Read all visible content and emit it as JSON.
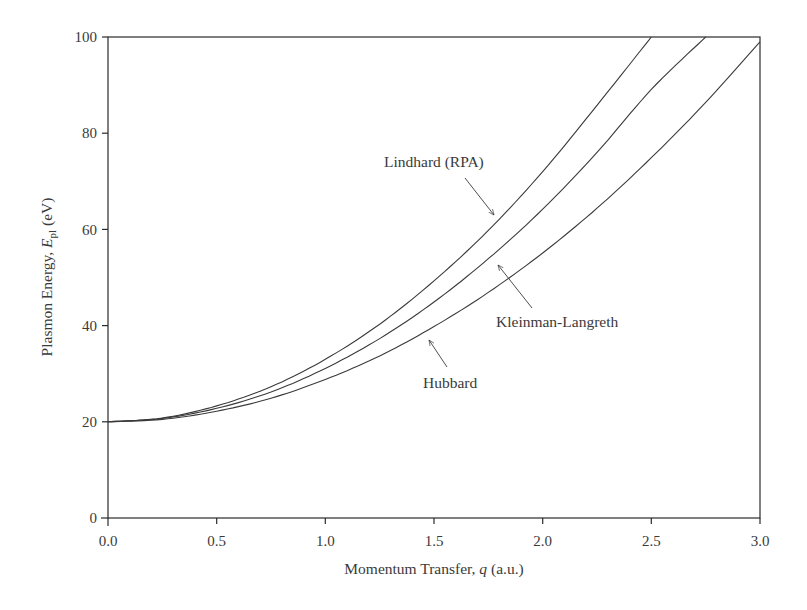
{
  "chart_data": {
    "type": "line",
    "title": "",
    "xlabel": "Momentum Transfer, q (a.u.)",
    "ylabel": "Plasmon Energy, E_pl (eV)",
    "xlim": [
      0.0,
      3.0
    ],
    "ylim": [
      0,
      100
    ],
    "grid": false,
    "legend": "none (inline annotations with arrows)",
    "x_ticks": [
      "0.0",
      "0.5",
      "1.0",
      "1.5",
      "2.0",
      "2.5",
      "3.0"
    ],
    "y_ticks": [
      "0",
      "20",
      "40",
      "60",
      "80",
      "100"
    ],
    "x": [
      0.0,
      0.25,
      0.5,
      0.75,
      1.0,
      1.25,
      1.5,
      1.75,
      2.0,
      2.25,
      2.5,
      2.75,
      3.0
    ],
    "series": [
      {
        "name": "Lindhard (RPA)",
        "values": [
          20.0,
          20.8,
          23.3,
          27.3,
          33.0,
          40.3,
          49.3,
          59.8,
          72.0,
          85.8,
          100.0,
          null,
          null
        ]
      },
      {
        "name": "Kleinman-Langreth",
        "values": [
          20.0,
          20.7,
          22.8,
          26.2,
          31.1,
          37.3,
          44.9,
          53.9,
          64.2,
          76.0,
          89.1,
          100.0,
          null
        ]
      },
      {
        "name": "Hubbard",
        "values": [
          20.0,
          20.5,
          22.2,
          24.9,
          28.8,
          33.7,
          39.8,
          46.9,
          55.1,
          64.4,
          74.9,
          86.4,
          99.0
        ]
      }
    ],
    "annotations": [
      {
        "text": "Lindhard (RPA)",
        "points_to": "Lindhard (RPA)",
        "at": [
          1.8,
          62
        ]
      },
      {
        "text": "Kleinman-Langreth",
        "points_to": "Kleinman-Langreth",
        "at": [
          1.8,
          53
        ]
      },
      {
        "text": "Hubbard",
        "points_to": "Hubbard",
        "at": [
          1.47,
          38
        ]
      }
    ]
  },
  "axes": {
    "x": {
      "label_main": "Momentum Transfer, ",
      "label_var": "q",
      "label_unit": " (a.u.)",
      "ticks": [
        "0.0",
        "0.5",
        "1.0",
        "1.5",
        "2.0",
        "2.5",
        "3.0"
      ]
    },
    "y": {
      "label_main": "Plasmon Energy, ",
      "label_var": "E",
      "label_sub": "pl",
      "label_unit": " (eV)",
      "ticks": [
        "0",
        "20",
        "40",
        "60",
        "80",
        "100"
      ]
    }
  },
  "annotations": {
    "lindhard": "Lindhard (RPA)",
    "kleinman": "Kleinman-Langreth",
    "hubbard": "Hubbard"
  },
  "colors": {
    "line": "#3a3a3a",
    "axis": "#2a2a2a",
    "text": "#3a3a3a"
  }
}
